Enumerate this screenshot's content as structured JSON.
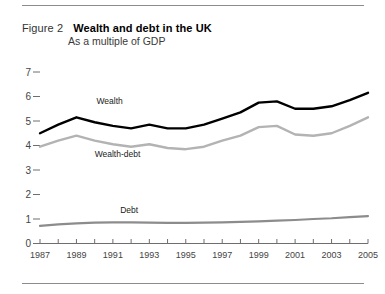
{
  "figure": {
    "label": "Figure 2",
    "title": "Wealth and debt in the UK",
    "subtitle": "As a multiple of GDP"
  },
  "chart_data": {
    "type": "line",
    "title": "Wealth and debt in the UK",
    "subtitle": "As a multiple of GDP",
    "xlabel": "",
    "ylabel": "",
    "xlim": [
      1987,
      2005
    ],
    "ylim": [
      0,
      7
    ],
    "yticks": [
      0,
      1,
      2,
      3,
      4,
      5,
      6,
      7
    ],
    "ytick_labels": [
      "0",
      "1",
      "2",
      "3",
      "4",
      "5",
      "6",
      "7"
    ],
    "x": [
      1987,
      1988,
      1989,
      1990,
      1991,
      1992,
      1993,
      1994,
      1995,
      1996,
      1997,
      1998,
      1999,
      2000,
      2001,
      2002,
      2003,
      2004,
      2005
    ],
    "xtick_labels": [
      "1987",
      "1989",
      "1991",
      "1993",
      "1995",
      "1997",
      "1999",
      "2001",
      "2003",
      "2005"
    ],
    "grid": false,
    "legend_position": "inline-annotations",
    "series": [
      {
        "name": "Wealth",
        "color": "#000000",
        "width": 2.4,
        "values": [
          4.5,
          4.85,
          5.15,
          4.95,
          4.8,
          4.7,
          4.85,
          4.7,
          4.7,
          4.85,
          5.1,
          5.35,
          5.75,
          5.8,
          5.5,
          5.5,
          5.6,
          5.85,
          6.15
        ],
        "label_x": 1990.1,
        "label_y": 5.7
      },
      {
        "name": "Wealth-debt",
        "color": "#b3b3b3",
        "width": 2.4,
        "values": [
          3.95,
          4.2,
          4.4,
          4.2,
          4.05,
          3.95,
          4.05,
          3.9,
          3.85,
          3.95,
          4.2,
          4.4,
          4.75,
          4.8,
          4.45,
          4.4,
          4.5,
          4.8,
          5.15
        ],
        "label_x": 1990.0,
        "label_y": 3.55
      },
      {
        "name": "Debt",
        "color": "#8c8c8c",
        "width": 2.2,
        "values": [
          0.72,
          0.78,
          0.82,
          0.85,
          0.86,
          0.86,
          0.85,
          0.84,
          0.84,
          0.85,
          0.86,
          0.88,
          0.9,
          0.93,
          0.96,
          1.0,
          1.03,
          1.08,
          1.12
        ],
        "label_x": 1991.4,
        "label_y": 1.25
      }
    ]
  }
}
